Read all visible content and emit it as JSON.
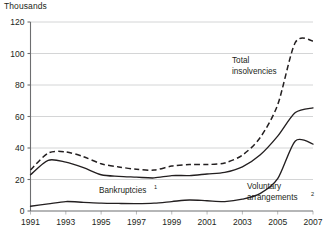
{
  "chart_data": {
    "type": "line",
    "title": "",
    "unit_label": "Thousands",
    "xlabel": "",
    "ylabel": "Thousands",
    "ylim": [
      0,
      120
    ],
    "xlim": [
      1991,
      2007
    ],
    "yticks": [
      0,
      20,
      40,
      60,
      80,
      100,
      120
    ],
    "ytick_labels": [
      "0",
      "20",
      "40",
      "60",
      "80",
      "100",
      "120"
    ],
    "xticks": [
      1991,
      1993,
      1995,
      1997,
      1999,
      2001,
      2003,
      2005,
      2007
    ],
    "xtick_labels": [
      "1991",
      "1993",
      "1995",
      "1997",
      "1999",
      "2001",
      "2003",
      "2005",
      "2007"
    ],
    "grid": "horizontal",
    "legend_position": "inline-annotations",
    "x": [
      1991,
      1992,
      1993,
      1994,
      1995,
      1996,
      1997,
      1998,
      1999,
      2000,
      2001,
      2002,
      2003,
      2004,
      2005,
      2006,
      2007
    ],
    "series": [
      {
        "name": "Total insolvencies",
        "style": "dashed",
        "values": [
          26.0,
          36.8,
          37.5,
          34.5,
          30.0,
          28.0,
          26.5,
          26.0,
          28.5,
          29.5,
          29.5,
          30.5,
          35.5,
          46.5,
          67.5,
          107.0,
          108.0
        ]
      },
      {
        "name": "Bankruptcies",
        "style": "solid",
        "values": [
          23.0,
          32.2,
          31.0,
          27.5,
          23.0,
          22.0,
          21.5,
          21.0,
          22.5,
          22.5,
          23.5,
          24.5,
          28.0,
          35.5,
          47.5,
          62.5,
          65.5
        ]
      },
      {
        "name": "Voluntary arrangements",
        "style": "solid",
        "values": [
          3.0,
          4.5,
          6.0,
          5.5,
          5.0,
          4.8,
          4.7,
          5.0,
          6.0,
          7.0,
          6.5,
          6.0,
          7.5,
          11.0,
          20.5,
          44.5,
          42.5
        ]
      }
    ],
    "annotations": [
      {
        "name": "total-insolvencies",
        "text": "Total",
        "text2": "insolvencies",
        "superscript": ""
      },
      {
        "name": "bankruptcies",
        "text": "Bankruptcies",
        "text2": "",
        "superscript": "1"
      },
      {
        "name": "voluntary-arrangements",
        "text": "Voluntary",
        "text2": "arrangements",
        "superscript": "2"
      }
    ],
    "colors": {
      "line": "#231f20",
      "grid": "#c9cacb",
      "axis": "#6d6e70",
      "background": "#ffffff"
    }
  }
}
